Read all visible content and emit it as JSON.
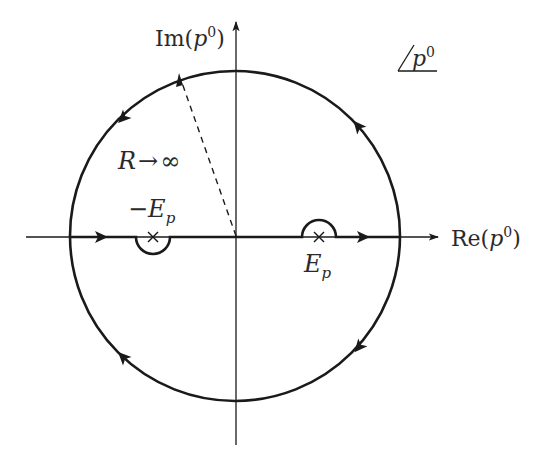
{
  "diagram": {
    "type": "complex-plane-contour",
    "colors": {
      "stroke": "#1a1a1a",
      "background": "#ffffff"
    },
    "axes": {
      "horizontal_label_prefix": "Re(",
      "horizontal_label_var": "p",
      "horizontal_label_sup": "0",
      "horizontal_label_suffix": ")",
      "vertical_label_prefix": "Im(",
      "vertical_label_var": "p",
      "vertical_label_sup": "0",
      "vertical_label_suffix": ")"
    },
    "plane_tag": {
      "var": "p",
      "sup": "0"
    },
    "radius_label": {
      "var": "R",
      "arrow": "→",
      "infinity": "∞"
    },
    "poles": [
      {
        "sign": "−",
        "var": "E",
        "sub": "p",
        "position": "negative-real",
        "detour": "below"
      },
      {
        "sign": "",
        "var": "E",
        "sub": "p",
        "position": "positive-real",
        "detour": "above"
      }
    ],
    "contour": {
      "circle_center": [
        235,
        236
      ],
      "circle_radius": 165,
      "arrow_directions": [
        "upper-right: up-left",
        "upper-left: down-left",
        "lower-left: up-left",
        "lower-right: down-left",
        "real-axis: rightward"
      ]
    }
  }
}
